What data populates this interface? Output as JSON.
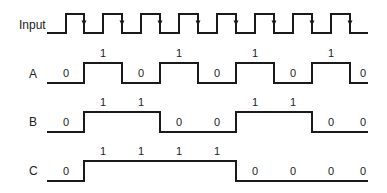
{
  "diagram": {
    "type": "timing-diagram",
    "colors": {
      "stroke": "#1a1a1a",
      "text": "#222222",
      "background": "#ffffff"
    },
    "x_start": 47,
    "x_end": 368,
    "input": {
      "label": "Input",
      "label_pos": [
        19,
        29
      ],
      "high_y": 14,
      "low_y": 33,
      "rising_edges": [
        66,
        103,
        141,
        179,
        217,
        255,
        293,
        331
      ],
      "falling_edges": [
        84,
        122,
        160,
        198,
        236,
        274,
        312,
        350
      ],
      "arrow_on": "falling"
    },
    "signals": [
      {
        "name": "A",
        "label_pos": [
          29,
          78
        ],
        "high_y": 63,
        "low_y": 83,
        "initial": 0,
        "edges": [
          84,
          122,
          160,
          198,
          236,
          274,
          312,
          350
        ],
        "bits": [
          {
            "v": "0",
            "x": 66,
            "y": 77
          },
          {
            "v": "1",
            "x": 103,
            "y": 57
          },
          {
            "v": "0",
            "x": 141,
            "y": 77
          },
          {
            "v": "1",
            "x": 179,
            "y": 57
          },
          {
            "v": "0",
            "x": 217,
            "y": 77
          },
          {
            "v": "1",
            "x": 255,
            "y": 57
          },
          {
            "v": "0",
            "x": 293,
            "y": 77
          },
          {
            "v": "1",
            "x": 331,
            "y": 57
          },
          {
            "v": "0",
            "x": 363,
            "y": 77
          }
        ]
      },
      {
        "name": "B",
        "label_pos": [
          29,
          126
        ],
        "high_y": 112,
        "low_y": 132,
        "initial": 0,
        "edges": [
          84,
          160,
          236,
          312
        ],
        "bits": [
          {
            "v": "0",
            "x": 66,
            "y": 126
          },
          {
            "v": "1",
            "x": 103,
            "y": 106
          },
          {
            "v": "1",
            "x": 141,
            "y": 106
          },
          {
            "v": "0",
            "x": 179,
            "y": 126
          },
          {
            "v": "0",
            "x": 217,
            "y": 126
          },
          {
            "v": "1",
            "x": 255,
            "y": 106
          },
          {
            "v": "1",
            "x": 293,
            "y": 106
          },
          {
            "v": "0",
            "x": 331,
            "y": 126
          },
          {
            "v": "0",
            "x": 363,
            "y": 126
          }
        ]
      },
      {
        "name": "C",
        "label_pos": [
          29,
          175
        ],
        "high_y": 161,
        "low_y": 181,
        "initial": 0,
        "edges": [
          84,
          236
        ],
        "bits": [
          {
            "v": "0",
            "x": 66,
            "y": 175
          },
          {
            "v": "1",
            "x": 103,
            "y": 155
          },
          {
            "v": "1",
            "x": 141,
            "y": 155
          },
          {
            "v": "1",
            "x": 179,
            "y": 155
          },
          {
            "v": "1",
            "x": 217,
            "y": 155
          },
          {
            "v": "0",
            "x": 255,
            "y": 175
          },
          {
            "v": "0",
            "x": 293,
            "y": 175
          },
          {
            "v": "0",
            "x": 331,
            "y": 175
          },
          {
            "v": "0",
            "x": 363,
            "y": 175
          }
        ]
      }
    ]
  }
}
